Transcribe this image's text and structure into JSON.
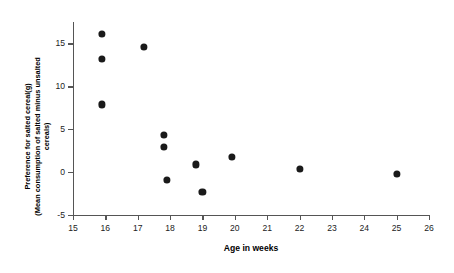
{
  "chart_data": {
    "type": "scatter",
    "title": "",
    "xlabel": "Age in weeks",
    "ylabel_line1": "Preference for salted cereal(g)",
    "ylabel_line2": "(Mean consumption of salted minus unsalted cereals)",
    "xlim": [
      15,
      26
    ],
    "ylim": [
      -5,
      17.5
    ],
    "xticks": [
      15,
      16,
      17,
      18,
      19,
      20,
      21,
      22,
      23,
      24,
      25,
      26
    ],
    "xtick_labels": [
      "15",
      "16",
      "17",
      "18",
      "19",
      "20",
      "21",
      "22",
      "23",
      "24",
      "25",
      "26"
    ],
    "yticks": [
      -5,
      0,
      5,
      10,
      15
    ],
    "ytick_labels": [
      "-5",
      "0",
      "5",
      "10",
      "15"
    ],
    "grid": false,
    "legend": "none",
    "marker": "filled-circle",
    "marker_color": "#1a1a1a",
    "points": [
      {
        "x": 15.9,
        "y": 16.1
      },
      {
        "x": 15.9,
        "y": 13.2
      },
      {
        "x": 15.9,
        "y": 7.9
      },
      {
        "x": 17.2,
        "y": 14.6
      },
      {
        "x": 17.8,
        "y": 4.3
      },
      {
        "x": 17.8,
        "y": 2.9
      },
      {
        "x": 17.9,
        "y": -0.9
      },
      {
        "x": 18.8,
        "y": 0.9
      },
      {
        "x": 19.0,
        "y": -2.3
      },
      {
        "x": 19.9,
        "y": 1.8
      },
      {
        "x": 22.0,
        "y": 0.4
      },
      {
        "x": 25.0,
        "y": -0.2
      }
    ]
  },
  "axis_titles": {
    "x": "Age in weeks",
    "y_line1": "Preference for salted cereal(g)",
    "y_line2": "(Mean consumption of salted minus unsalted",
    "y_line3": "cereals)"
  }
}
